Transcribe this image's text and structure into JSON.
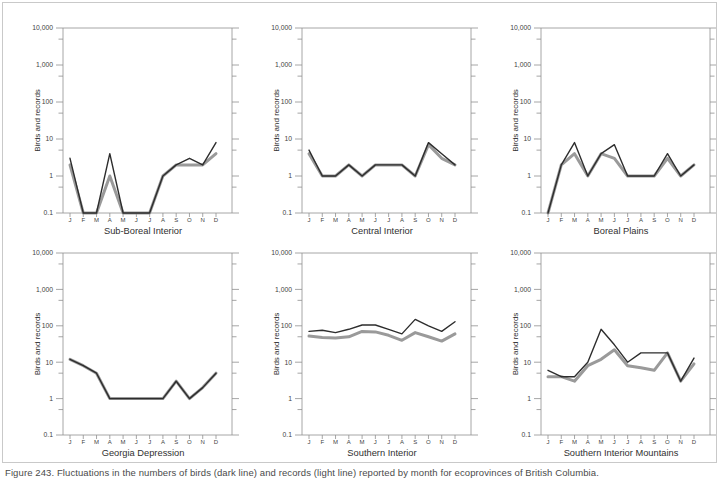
{
  "figure": {
    "ylabel": "Birds and records",
    "y_tick_labels": [
      "10,000",
      "1,000",
      "100",
      "10",
      "1",
      "0.1"
    ],
    "months": [
      "J",
      "F",
      "M",
      "A",
      "M",
      "J",
      "J",
      "A",
      "S",
      "O",
      "N",
      "D"
    ],
    "caption": "Figure 243. Fluctuations in the numbers of birds (dark line) and records (light line) reported by month for ecoprovinces of British Columbia.",
    "colors": {
      "dark_line": "#2d2d2d",
      "grey_line": "#9a9a9a",
      "axis": "#8f8f8f",
      "tick_text": "#3f3f3f",
      "title_text": "#303030",
      "frame_border": "#c9c9c9"
    }
  },
  "chart_data": [
    {
      "type": "line",
      "title": "Sub-Boreal Interior",
      "xlabel": "Sub-Boreal Interior",
      "ylabel": "Birds and records",
      "x": [
        "J",
        "F",
        "M",
        "A",
        "M",
        "J",
        "J",
        "A",
        "S",
        "O",
        "N",
        "D"
      ],
      "y_scale": "log",
      "ylim": [
        0.1,
        10000
      ],
      "series": [
        {
          "name": "birds (dark line)",
          "color_key": "dark_line",
          "values": [
            3,
            0.1,
            0.1,
            4,
            0.1,
            0.1,
            0.1,
            1,
            2,
            3,
            2,
            8
          ]
        },
        {
          "name": "records (grey line)",
          "color_key": "grey_line",
          "values": [
            2,
            0.1,
            0.1,
            1,
            0.1,
            0.1,
            0.1,
            1,
            2,
            2,
            2,
            4
          ]
        }
      ]
    },
    {
      "type": "line",
      "title": "Central Interior",
      "xlabel": "Central Interior",
      "ylabel": "Birds and records",
      "x": [
        "J",
        "F",
        "M",
        "A",
        "M",
        "J",
        "J",
        "A",
        "S",
        "O",
        "N",
        "D"
      ],
      "y_scale": "log",
      "ylim": [
        0.1,
        10000
      ],
      "series": [
        {
          "name": "birds (dark line)",
          "color_key": "dark_line",
          "values": [
            5,
            1,
            1,
            2,
            1,
            2,
            2,
            2,
            1,
            8,
            4,
            2
          ]
        },
        {
          "name": "records (grey line)",
          "color_key": "grey_line",
          "values": [
            4,
            1,
            1,
            2,
            1,
            2,
            2,
            2,
            1,
            7,
            3,
            2
          ]
        }
      ]
    },
    {
      "type": "line",
      "title": "Boreal Plains",
      "xlabel": "Boreal Plains",
      "ylabel": "Birds and records",
      "x": [
        "J",
        "F",
        "M",
        "A",
        "M",
        "J",
        "J",
        "A",
        "S",
        "O",
        "N",
        "D"
      ],
      "y_scale": "log",
      "ylim": [
        0.1,
        10000
      ],
      "series": [
        {
          "name": "birds (dark line)",
          "color_key": "dark_line",
          "values": [
            0.1,
            2,
            8,
            1,
            4,
            7,
            1,
            1,
            1,
            4,
            1,
            2
          ]
        },
        {
          "name": "records (grey line)",
          "color_key": "grey_line",
          "values": [
            0.1,
            2,
            4,
            1,
            4,
            3,
            1,
            1,
            1,
            3,
            1,
            2
          ]
        }
      ]
    },
    {
      "type": "line",
      "title": "Georgia Depression",
      "xlabel": "Georgia Depression",
      "ylabel": "Birds and records",
      "x": [
        "J",
        "F",
        "M",
        "A",
        "M",
        "J",
        "J",
        "A",
        "S",
        "O",
        "N",
        "D"
      ],
      "y_scale": "log",
      "ylim": [
        0.1,
        10000
      ],
      "series": [
        {
          "name": "birds (dark line)",
          "color_key": "dark_line",
          "values": [
            12,
            8,
            5,
            1,
            1,
            1,
            1,
            1,
            3,
            1,
            2,
            5
          ]
        },
        {
          "name": "records (grey line)",
          "color_key": "grey_line",
          "values": [
            12,
            8,
            5,
            1,
            1,
            1,
            1,
            1,
            3,
            1,
            2,
            5
          ]
        }
      ]
    },
    {
      "type": "line",
      "title": "Southern Interior",
      "xlabel": "Southern Interior",
      "ylabel": "Birds and records",
      "x": [
        "J",
        "F",
        "M",
        "A",
        "M",
        "J",
        "J",
        "A",
        "S",
        "O",
        "N",
        "D"
      ],
      "y_scale": "log",
      "ylim": [
        0.1,
        10000
      ],
      "series": [
        {
          "name": "birds (dark line)",
          "color_key": "dark_line",
          "values": [
            70,
            75,
            65,
            80,
            105,
            105,
            80,
            60,
            150,
            100,
            70,
            130
          ]
        },
        {
          "name": "records (grey line)",
          "color_key": "grey_line",
          "values": [
            52,
            48,
            46,
            50,
            70,
            68,
            55,
            40,
            65,
            50,
            38,
            60
          ]
        }
      ]
    },
    {
      "type": "line",
      "title": "Southern Interior Mountains",
      "xlabel": "Southern Interior Mountains",
      "ylabel": "Birds and records",
      "x": [
        "J",
        "F",
        "M",
        "A",
        "M",
        "J",
        "J",
        "A",
        "S",
        "O",
        "N",
        "D"
      ],
      "y_scale": "log",
      "ylim": [
        0.1,
        10000
      ],
      "series": [
        {
          "name": "birds (dark line)",
          "color_key": "dark_line",
          "values": [
            6,
            4,
            4,
            10,
            80,
            30,
            10,
            18,
            18,
            18,
            3,
            13
          ]
        },
        {
          "name": "records (grey line)",
          "color_key": "grey_line",
          "values": [
            4,
            4,
            3,
            8,
            12,
            22,
            8,
            7,
            6,
            18,
            3,
            9
          ]
        }
      ]
    }
  ]
}
